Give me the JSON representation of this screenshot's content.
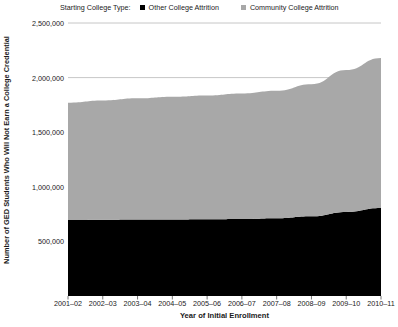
{
  "legend": {
    "title": "Starting College Type:",
    "entries": [
      {
        "label": "Other College Attrition",
        "color": "#000000",
        "marker": "legend-swatch-black"
      },
      {
        "label": "Community College Attrition",
        "color": "#a8a8a8",
        "marker": "legend-swatch-gray"
      }
    ]
  },
  "chart_data": {
    "type": "area",
    "stacked": true,
    "title": "",
    "xlabel": "Year of Initial Enrollment",
    "ylabel": "Number of GED Students Who Will Not Earn a College Credential",
    "categories": [
      "2001–02",
      "2002–03",
      "2003–04",
      "2004–05",
      "2005–06",
      "2006–07",
      "2007–08",
      "2008–09",
      "2009–10",
      "2010–11"
    ],
    "series": [
      {
        "name": "Other College Attrition",
        "color": "#000000",
        "values": [
          695000,
          698000,
          700000,
          700000,
          702000,
          705000,
          712000,
          730000,
          770000,
          805000
        ]
      },
      {
        "name": "Community College Attrition",
        "color": "#a8a8a8",
        "values": [
          1075000,
          1092000,
          1110000,
          1125000,
          1135000,
          1150000,
          1168000,
          1210000,
          1300000,
          1375000
        ]
      }
    ],
    "totals": [
      1770000,
      1790000,
      1810000,
      1825000,
      1837000,
      1855000,
      1880000,
      1940000,
      2070000,
      2180000
    ],
    "ylim": [
      0,
      2500000
    ],
    "yticks": [
      0,
      500000,
      1000000,
      1500000,
      2000000,
      2500000
    ],
    "ytick_labels": [
      "0",
      "500,000",
      "1,000,000",
      "1,500,000",
      "2,000,000",
      "2,500,000"
    ],
    "visible_ytick_labels": [
      "500,000",
      "1,000,000",
      "1,500,000",
      "2,000,000",
      "2,500,000"
    ],
    "grid": true,
    "legend_position": "top"
  }
}
